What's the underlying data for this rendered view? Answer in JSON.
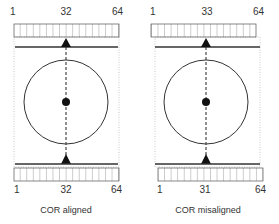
{
  "colors": {
    "stroke": "#333333",
    "dotted_border": "#bbbbbb",
    "background": "#ffffff"
  },
  "panels": [
    {
      "id": "aligned",
      "caption": "COR aligned",
      "top_labels": {
        "left": "1",
        "center": "32",
        "right": "64"
      },
      "bottom_labels": {
        "left": "1",
        "center": "31",
        "right": "64"
      },
      "bottom_center_value": "32",
      "detector_cells": 16
    },
    {
      "id": "misaligned",
      "caption": "COR misaligned",
      "top_labels": {
        "left": "1",
        "center": "33",
        "right": "64"
      },
      "bottom_labels": {
        "left": "1",
        "center": "31",
        "right": "64"
      },
      "detector_cells": 16
    }
  ],
  "left": {
    "caption": "COR aligned",
    "top": {
      "min": "1",
      "center": "32",
      "max": "64"
    },
    "bottom": {
      "min": "1",
      "center": "32",
      "max": "64"
    }
  },
  "right": {
    "caption": "COR misaligned",
    "top": {
      "min": "1",
      "center": "33",
      "max": "64"
    },
    "bottom": {
      "min": "1",
      "center": "31",
      "max": "64"
    }
  }
}
